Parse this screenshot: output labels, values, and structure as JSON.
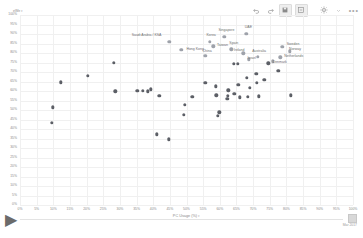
{
  "toolbar": {
    "buttons": [
      {
        "name": "undo-icon",
        "label": "Undo"
      },
      {
        "name": "redo-icon",
        "label": "Redo"
      },
      {
        "name": "save-icon",
        "label": "Save"
      },
      {
        "name": "revert-icon",
        "label": "Revert"
      },
      {
        "name": "settings-gear-icon",
        "label": "Settings"
      },
      {
        "name": "chevron-down-icon",
        "label": "More options"
      }
    ],
    "more_label": "•••"
  },
  "timeline": {
    "play_label": "▶",
    "caption": "Mar 2017"
  },
  "chart_data": {
    "type": "scatter",
    "title": "",
    "xlabel": "PC Usage (%)",
    "ylabel": "eWe",
    "xlim": [
      0,
      100
    ],
    "ylim": [
      0,
      100
    ],
    "grid": true,
    "legend": "none",
    "xticks": [
      "0%",
      "5%",
      "10%",
      "15%",
      "20%",
      "25%",
      "30%",
      "35%",
      "40%",
      "45%",
      "50%",
      "55%",
      "60%",
      "65%",
      "70%",
      "75%",
      "80%",
      "85%",
      "90%",
      "95%",
      "100%"
    ],
    "yticks": [
      "0%",
      "5%",
      "10%",
      "15%",
      "20%",
      "25%",
      "30%",
      "35%",
      "40%",
      "45%",
      "50%",
      "55%",
      "60%",
      "65%",
      "70%",
      "75%",
      "80%",
      "85%",
      "90%",
      "95%",
      "100%"
    ],
    "points": [
      {
        "label": "Saudi Arabia / KSA",
        "x": 44.8,
        "y": 85.8,
        "highlight": true,
        "lx": 38.0,
        "ly": 88.8
      },
      {
        "label": "Korea",
        "x": 57.0,
        "y": 86.0,
        "highlight": true,
        "lx": 57.4,
        "ly": 89.0
      },
      {
        "label": "Singapore",
        "x": 61.4,
        "y": 88.6,
        "highlight": true,
        "lx": 62.0,
        "ly": 91.6
      },
      {
        "label": "UAE",
        "x": 68.0,
        "y": 90.2,
        "highlight": true,
        "lx": 68.6,
        "ly": 93.2
      },
      {
        "label": "Hong Kong",
        "x": 48.4,
        "y": 81.8,
        "highlight": true,
        "lx": 52.6,
        "ly": 81.8
      },
      {
        "label": "Taiwan",
        "x": 58.0,
        "y": 83.6,
        "highlight": true,
        "lx": 60.8,
        "ly": 83.6
      },
      {
        "label": "Spain",
        "x": 63.4,
        "y": 82.0,
        "highlight": true,
        "lx": 64.2,
        "ly": 84.8
      },
      {
        "label": "China",
        "x": 55.6,
        "y": 78.4,
        "highlight": true,
        "lx": 56.2,
        "ly": 80.4
      },
      {
        "label": "Ireland",
        "x": 67.0,
        "y": 79.8,
        "highlight": true,
        "lx": 65.8,
        "ly": 80.8
      },
      {
        "label": "Israel",
        "x": 68.8,
        "y": 76.6,
        "highlight": true,
        "lx": 69.6,
        "ly": 76.8
      },
      {
        "label": "Australia",
        "x": 71.4,
        "y": 78.0,
        "highlight": true,
        "lx": 71.8,
        "ly": 80.6
      },
      {
        "label": "Sweden",
        "x": 78.8,
        "y": 83.2,
        "highlight": true,
        "lx": 82.0,
        "ly": 84.4
      },
      {
        "label": "Norway",
        "x": 81.0,
        "y": 80.8,
        "highlight": true,
        "lx": 82.6,
        "ly": 81.4
      },
      {
        "label": "Netherlands",
        "x": 78.2,
        "y": 77.8,
        "highlight": true,
        "lx": 82.2,
        "ly": 77.8
      },
      {
        "label": "Denmark",
        "x": 76.0,
        "y": 75.6,
        "highlight": true,
        "lx": 78.0,
        "ly": 74.6
      },
      {
        "label": "",
        "x": 28.2,
        "y": 74.8,
        "highlight": false
      },
      {
        "label": "",
        "x": 20.4,
        "y": 68.0,
        "highlight": false
      },
      {
        "label": "",
        "x": 12.2,
        "y": 64.6,
        "highlight": false
      },
      {
        "label": "",
        "x": 28.6,
        "y": 59.8,
        "highlight": false
      },
      {
        "label": "",
        "x": 35.2,
        "y": 60.0,
        "highlight": false
      },
      {
        "label": "",
        "x": 36.8,
        "y": 60.0,
        "highlight": false
      },
      {
        "label": "",
        "x": 38.4,
        "y": 59.8,
        "highlight": false
      },
      {
        "label": "",
        "x": 39.2,
        "y": 60.8,
        "highlight": false
      },
      {
        "label": "",
        "x": 41.8,
        "y": 57.6,
        "highlight": false
      },
      {
        "label": "",
        "x": 9.8,
        "y": 51.4,
        "highlight": false
      },
      {
        "label": "",
        "x": 9.6,
        "y": 43.4,
        "highlight": false
      },
      {
        "label": "",
        "x": 41.0,
        "y": 37.2,
        "highlight": false
      },
      {
        "label": "",
        "x": 44.6,
        "y": 34.6,
        "highlight": false
      },
      {
        "label": "",
        "x": 49.4,
        "y": 52.6,
        "highlight": false
      },
      {
        "label": "",
        "x": 49.2,
        "y": 47.6,
        "highlight": false
      },
      {
        "label": "",
        "x": 51.8,
        "y": 56.8,
        "highlight": false
      },
      {
        "label": "",
        "x": 55.6,
        "y": 64.4,
        "highlight": false
      },
      {
        "label": "",
        "x": 58.8,
        "y": 62.4,
        "highlight": false
      },
      {
        "label": "",
        "x": 59.0,
        "y": 57.8,
        "highlight": false
      },
      {
        "label": "",
        "x": 59.8,
        "y": 48.8,
        "highlight": false
      },
      {
        "label": "",
        "x": 59.4,
        "y": 46.8,
        "highlight": false
      },
      {
        "label": "",
        "x": 62.6,
        "y": 60.4,
        "highlight": false
      },
      {
        "label": "",
        "x": 62.4,
        "y": 57.4,
        "highlight": false
      },
      {
        "label": "",
        "x": 62.2,
        "y": 55.8,
        "highlight": false
      },
      {
        "label": "",
        "x": 64.4,
        "y": 58.4,
        "highlight": false
      },
      {
        "label": "",
        "x": 64.2,
        "y": 74.2,
        "highlight": false
      },
      {
        "label": "",
        "x": 65.4,
        "y": 74.2,
        "highlight": false
      },
      {
        "label": "",
        "x": 65.6,
        "y": 63.4,
        "highlight": false
      },
      {
        "label": "",
        "x": 66.0,
        "y": 56.6,
        "highlight": false
      },
      {
        "label": "",
        "x": 68.4,
        "y": 57.0,
        "highlight": false
      },
      {
        "label": "",
        "x": 68.2,
        "y": 67.0,
        "highlight": false
      },
      {
        "label": "",
        "x": 69.0,
        "y": 61.6,
        "highlight": false
      },
      {
        "label": "",
        "x": 71.0,
        "y": 69.0,
        "highlight": false
      },
      {
        "label": "",
        "x": 71.2,
        "y": 64.4,
        "highlight": false
      },
      {
        "label": "",
        "x": 71.8,
        "y": 57.2,
        "highlight": false
      },
      {
        "label": "",
        "x": 73.4,
        "y": 66.0,
        "highlight": false
      },
      {
        "label": "",
        "x": 74.6,
        "y": 74.6,
        "highlight": false
      },
      {
        "label": "",
        "x": 77.6,
        "y": 70.6,
        "highlight": false
      },
      {
        "label": "",
        "x": 81.4,
        "y": 57.8,
        "highlight": false
      }
    ]
  }
}
